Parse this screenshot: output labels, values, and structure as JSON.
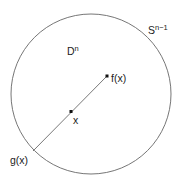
{
  "diagram": {
    "colors": {
      "stroke": "#555555",
      "point": "#111111",
      "text": "#222222",
      "background": "#ffffff"
    },
    "sphere_label": {
      "base": "S",
      "superscript": "n−1"
    },
    "disk_label": {
      "base": "D",
      "superscript": "n"
    },
    "points": {
      "fx": "f(x)",
      "x": "x",
      "gx": "g(x)"
    }
  }
}
